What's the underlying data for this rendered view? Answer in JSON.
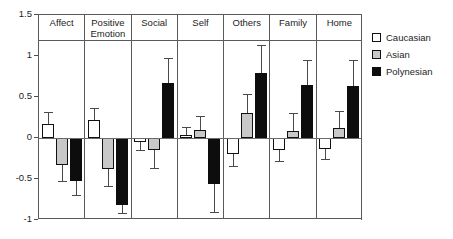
{
  "chart_data": {
    "type": "bar",
    "title": "",
    "subtitle": "",
    "xlabel": "",
    "ylabel": "",
    "ylim": [
      -1,
      1.5
    ],
    "yticks": [
      1.5,
      1,
      0.5,
      0,
      -0.5,
      -1
    ],
    "ytick_labels": [
      "1.5",
      "1",
      "0.5",
      "0",
      "-0.5",
      "-1"
    ],
    "grid": false,
    "zero_line": true,
    "legend_position": "right",
    "error_bars": "symmetric",
    "categories": [
      "Affect",
      "Positive Emotion",
      "Social",
      "Self",
      "Others",
      "Family",
      "Home"
    ],
    "series": [
      {
        "name": "Caucasian",
        "color": "#ffffff",
        "values": [
          0.17,
          0.22,
          -0.05,
          0.04,
          -0.2,
          -0.15,
          -0.13
        ],
        "errors": [
          0.15,
          0.15,
          0.1,
          0.1,
          0.14,
          0.13,
          0.13
        ]
      },
      {
        "name": "Asian",
        "color": "#c8c8c8",
        "values": [
          -0.33,
          -0.38,
          -0.15,
          0.1,
          0.3,
          0.09,
          0.12
        ],
        "errors": [
          0.19,
          0.21,
          0.21,
          0.17,
          0.24,
          0.22,
          0.21
        ]
      },
      {
        "name": "Polynesian",
        "color": "#0d0d0d",
        "values": [
          -0.52,
          -0.82,
          0.67,
          -0.56,
          0.79,
          0.65,
          0.63
        ],
        "errors": [
          0.17,
          0.09,
          0.3,
          0.34,
          0.35,
          0.3,
          0.32
        ]
      }
    ]
  },
  "legend": {
    "items": [
      {
        "label": "Caucasian",
        "swatch": "caucasian"
      },
      {
        "label": "Asian",
        "swatch": "asian"
      },
      {
        "label": "Polynesian",
        "swatch": "polynesian"
      }
    ]
  }
}
